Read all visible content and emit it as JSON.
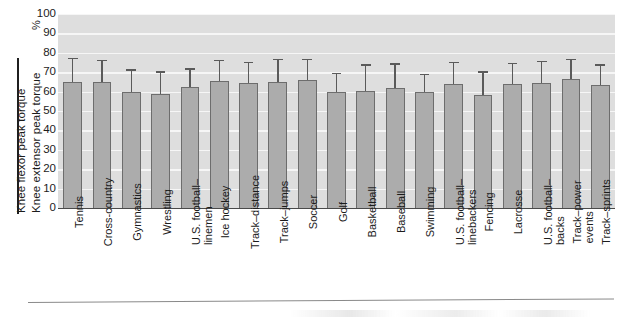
{
  "chart_data": {
    "type": "bar",
    "title": "",
    "xlabel": "",
    "ylabel_numerator": "Knee flexor peak torque",
    "ylabel_denominator": "Knee extensor peak torque",
    "ylabel_unit": "%",
    "ylim": [
      0,
      100
    ],
    "ytick_labels": [
      "100",
      "90",
      "80",
      "70",
      "60",
      "50",
      "40",
      "30",
      "20",
      "10",
      "0"
    ],
    "ytick_values": [
      100,
      90,
      80,
      70,
      60,
      50,
      40,
      30,
      20,
      10,
      0
    ],
    "grid": "horizontal",
    "legend": "none",
    "categories": [
      "Tennis",
      "Cross-country",
      "Gymnastics",
      "Wrestling",
      "U.S. football–linemen",
      "Ice hockey",
      "Track–distance",
      "Track–jumps",
      "Soccer",
      "Golf",
      "Basketball",
      "Baseball",
      "Swimming",
      "U.S. football–linebackers",
      "Fencing",
      "Lacrosse",
      "U.S. football–backs",
      "Track–power events",
      "Track–sprints"
    ],
    "category_lines": [
      [
        "Tennis"
      ],
      [
        "Cross-country"
      ],
      [
        "Gymnastics"
      ],
      [
        "Wrestling"
      ],
      [
        "U.S. football–",
        "linemen"
      ],
      [
        "Ice hockey"
      ],
      [
        "Track–distance"
      ],
      [
        "Track–jumps"
      ],
      [
        "Soccer"
      ],
      [
        "Golf"
      ],
      [
        "Basketball"
      ],
      [
        "Baseball"
      ],
      [
        "Swimming"
      ],
      [
        "U.S. football–",
        "linebackers"
      ],
      [
        "Fencing"
      ],
      [
        "Lacrosse"
      ],
      [
        "U.S. football–",
        "backs"
      ],
      [
        "Track–power",
        "events"
      ],
      [
        "Track–sprints"
      ]
    ],
    "values": [
      65,
      65,
      60,
      59,
      62.5,
      65.5,
      64.5,
      65,
      66,
      60,
      60.5,
      62,
      60,
      64,
      58,
      64,
      64.5,
      66.5,
      63.5
    ],
    "errors_upper": [
      77.5,
      76.5,
      71.5,
      70.5,
      72,
      76.5,
      75.5,
      77,
      77,
      69.5,
      74,
      74.5,
      69,
      75.5,
      70.5,
      75,
      76,
      77,
      74
    ],
    "series_name": "Hamstring-to-quadriceps ratio",
    "bar_color": "#acacac",
    "bar_edge_color": "#6d6d6d",
    "error_color": "#5a5a5a",
    "plot_background": "#dedede",
    "gridline_color": "#f6f6f6"
  }
}
